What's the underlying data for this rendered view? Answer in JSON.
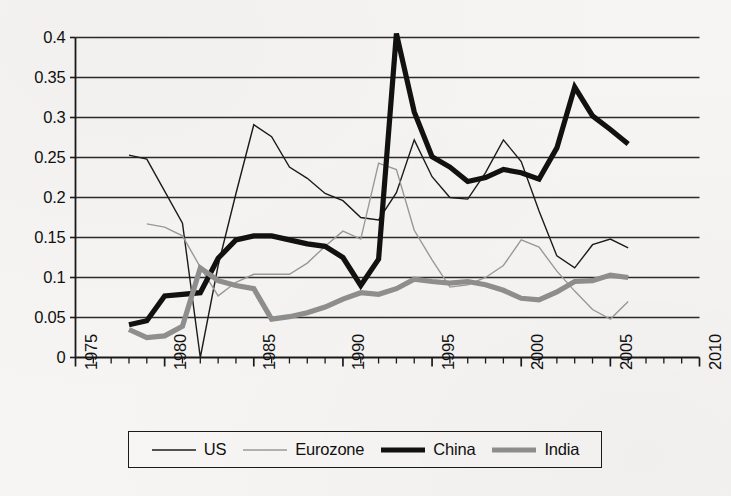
{
  "figure": {
    "background_color": "#f6f5f3",
    "axis_color": "#1a1a1a",
    "gridline_color": "#2b2b2b"
  },
  "legend": {
    "position": "bottom",
    "entries": [
      {
        "label": "US",
        "color": "#1b1b1b",
        "width": 1.4,
        "swatch_name": "legend-swatch-us"
      },
      {
        "label": "Eurozone",
        "color": "#9a9a9a",
        "width": 1.4,
        "swatch_name": "legend-swatch-eurozone"
      },
      {
        "label": "China",
        "color": "#111111",
        "width": 5.2,
        "swatch_name": "legend-swatch-china"
      },
      {
        "label": "India",
        "color": "#8f8f8f",
        "width": 5.2,
        "swatch_name": "legend-swatch-india"
      }
    ]
  },
  "chart_data": {
    "type": "line",
    "title": "",
    "subtitle": "",
    "xlabel": "",
    "ylabel": "",
    "xlim": [
      1975,
      2010
    ],
    "ylim": [
      0,
      0.4
    ],
    "xticks": [
      1975,
      1980,
      1985,
      1990,
      1995,
      2000,
      2005,
      2010
    ],
    "xtick_labels": [
      "1975",
      "1980",
      "1985",
      "1990",
      "1995",
      "2000",
      "2005",
      "2010"
    ],
    "minor_xticks_interval": 1,
    "yticks": [
      0,
      0.05,
      0.1,
      0.15,
      0.2,
      0.25,
      0.3,
      0.35,
      0.4
    ],
    "ytick_labels": [
      "0",
      "0.05",
      "0.1",
      "0.15",
      "0.2",
      "0.25",
      "0.3",
      "0.35",
      "0.4"
    ],
    "grid": "horizontal",
    "legend_position": "bottom",
    "series": [
      {
        "name": "US",
        "color": "#1b1b1b",
        "width": 1.4,
        "x": [
          1978,
          1979,
          1980,
          1981,
          1982,
          1983,
          1984,
          1985,
          1986,
          1987,
          1988,
          1989,
          1990,
          1991,
          1992,
          1993,
          1994,
          1995,
          1996,
          1997,
          1998,
          1999,
          2000,
          2001,
          2002,
          2003,
          2004,
          2005,
          2006
        ],
        "values": [
          0.253,
          0.248,
          0.208,
          0.168,
          0.0,
          0.115,
          0.205,
          0.291,
          0.276,
          0.238,
          0.224,
          0.205,
          0.196,
          0.175,
          0.172,
          0.206,
          0.272,
          0.226,
          0.2,
          0.198,
          0.231,
          0.272,
          0.245,
          0.183,
          0.127,
          0.112,
          0.141,
          0.148,
          0.137
        ]
      },
      {
        "name": "Eurozone",
        "color": "#9a9a9a",
        "width": 1.4,
        "x": [
          1979,
          1980,
          1981,
          1982,
          1983,
          1984,
          1985,
          1986,
          1987,
          1988,
          1989,
          1990,
          1991,
          1992,
          1993,
          1994,
          1995,
          1996,
          1997,
          1998,
          1999,
          2000,
          2001,
          2002,
          2003,
          2004,
          2005,
          2006
        ],
        "values": [
          0.167,
          0.163,
          0.152,
          0.113,
          0.077,
          0.094,
          0.104,
          0.104,
          0.104,
          0.118,
          0.139,
          0.158,
          0.148,
          0.243,
          0.235,
          0.159,
          0.122,
          0.088,
          0.091,
          0.1,
          0.115,
          0.147,
          0.138,
          0.108,
          0.083,
          0.06,
          0.048,
          0.07
        ]
      },
      {
        "name": "China",
        "color": "#111111",
        "width": 5.2,
        "x": [
          1978,
          1979,
          1980,
          1981,
          1982,
          1983,
          1984,
          1985,
          1986,
          1987,
          1988,
          1989,
          1990,
          1991,
          1992,
          1993,
          1994,
          1995,
          1996,
          1997,
          1998,
          1999,
          2000,
          2001,
          2002,
          2003,
          2004,
          2005,
          2006
        ],
        "values": [
          0.041,
          0.046,
          0.077,
          0.079,
          0.081,
          0.124,
          0.147,
          0.152,
          0.152,
          0.147,
          0.142,
          0.139,
          0.125,
          0.09,
          0.123,
          0.405,
          0.307,
          0.251,
          0.238,
          0.22,
          0.225,
          0.235,
          0.231,
          0.223,
          0.262,
          0.338,
          0.302,
          0.285,
          0.267
        ]
      },
      {
        "name": "India",
        "color": "#8f8f8f",
        "width": 5.2,
        "x": [
          1978,
          1979,
          1980,
          1981,
          1982,
          1983,
          1984,
          1985,
          1986,
          1987,
          1988,
          1989,
          1990,
          1991,
          1992,
          1993,
          1994,
          1995,
          1996,
          1997,
          1998,
          1999,
          2000,
          2001,
          2002,
          2003,
          2004,
          2005,
          2006
        ],
        "values": [
          0.035,
          0.025,
          0.027,
          0.039,
          0.112,
          0.096,
          0.09,
          0.086,
          0.048,
          0.051,
          0.056,
          0.063,
          0.073,
          0.081,
          0.079,
          0.086,
          0.098,
          0.095,
          0.093,
          0.095,
          0.091,
          0.084,
          0.074,
          0.072,
          0.082,
          0.095,
          0.096,
          0.103,
          0.1
        ]
      }
    ]
  }
}
